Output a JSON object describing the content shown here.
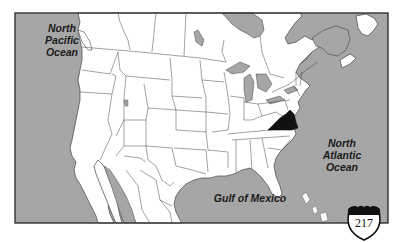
{
  "map": {
    "title": "North America political outline map",
    "highlighted_region": "Virginia",
    "colors": {
      "water": "#a6a6a6",
      "land": "#ffffff",
      "borders": "#444444",
      "highlight": "#111111",
      "frame": "#333333"
    },
    "labels": {
      "pacific": "North\nPacific\nOcean",
      "pacific_lines": [
        "North",
        "Pacific",
        "Ocean"
      ],
      "atlantic_lines": [
        "North",
        "Atlantic",
        "Ocean"
      ],
      "gulf": "Gulf of Mexico"
    }
  },
  "badge": {
    "icon": "interstate-shield-icon",
    "page_number": "217"
  }
}
